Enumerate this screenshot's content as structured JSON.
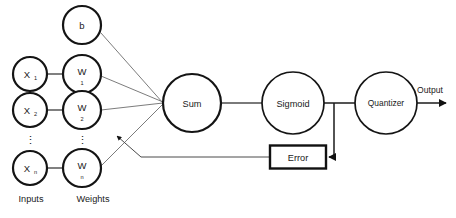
{
  "diagram": {
    "background_color": "#ffffff",
    "stroke_color": "#141414"
  },
  "bias": {
    "label": "b"
  },
  "inputs": {
    "column_label": "Inputs",
    "nodes": [
      {
        "base": "X",
        "sub": "1"
      },
      {
        "base": "X",
        "sub": "2"
      },
      {
        "base": "X",
        "sub": "n"
      }
    ],
    "ellipsis": "⋮"
  },
  "weights": {
    "column_label": "Weights",
    "nodes": [
      {
        "base": "W",
        "sub": "1"
      },
      {
        "base": "W",
        "sub": "2"
      },
      {
        "base": "W",
        "sub": "n"
      }
    ],
    "ellipsis": "⋮"
  },
  "blocks": {
    "sum": "Sum",
    "sigmoid": "Sigmoid",
    "quantizer": "Quantizer",
    "error": "Error"
  },
  "output": {
    "label": "Output"
  }
}
